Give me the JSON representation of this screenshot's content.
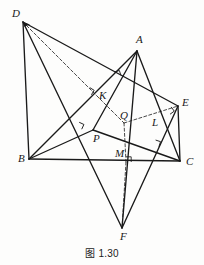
{
  "figure": {
    "caption": "图 1.30",
    "stroke_color": "#1a1a1a",
    "thin_stroke_color": "#4a4a4a",
    "background": "#fdfdfc",
    "vertices": [
      {
        "id": "D",
        "label": "D",
        "x": 23,
        "y": 22,
        "lx": 12,
        "ly": 17
      },
      {
        "id": "A",
        "label": "A",
        "x": 137,
        "y": 51,
        "lx": 136,
        "ly": 43
      },
      {
        "id": "B",
        "label": "B",
        "x": 29,
        "y": 159,
        "lx": 18,
        "ly": 162
      },
      {
        "id": "C",
        "label": "C",
        "x": 180,
        "y": 161,
        "lx": 186,
        "ly": 165
      },
      {
        "id": "E",
        "label": "E",
        "x": 178,
        "y": 106,
        "lx": 182,
        "ly": 106
      },
      {
        "id": "F",
        "label": "F",
        "x": 122,
        "y": 228,
        "lx": 120,
        "ly": 240
      },
      {
        "id": "K",
        "label": "K",
        "x": 87,
        "y": 92,
        "lx": 99,
        "ly": 99
      },
      {
        "id": "Q",
        "label": "Q",
        "x": 124,
        "y": 123,
        "lx": 120,
        "ly": 119
      },
      {
        "id": "P",
        "label": "P",
        "x": 93,
        "y": 130,
        "lx": 93,
        "ly": 142
      },
      {
        "id": "L",
        "label": "L",
        "x": 168,
        "y": 110,
        "lx": 152,
        "ly": 126
      },
      {
        "id": "M",
        "label": "M",
        "x": 126,
        "y": 162,
        "lx": 115,
        "ly": 157
      }
    ],
    "solid_segments": [
      {
        "name": "segment-BC",
        "from": "B",
        "to": "C"
      },
      {
        "name": "segment-AB",
        "from": "B",
        "to": "A"
      },
      {
        "name": "segment-AC",
        "from": "A",
        "to": "C"
      },
      {
        "name": "segment-BP",
        "from": "B",
        "to": "P"
      },
      {
        "name": "segment-PC",
        "from": "P",
        "to": "C"
      },
      {
        "name": "segment-PA",
        "from": "P",
        "to": "A"
      },
      {
        "name": "segment-DB",
        "from": "D",
        "to": "B"
      },
      {
        "name": "segment-DE",
        "from": "D",
        "to": "E"
      },
      {
        "name": "segment-DF",
        "from": "D",
        "to": "F"
      },
      {
        "name": "segment-EC",
        "from": "E",
        "to": "C"
      },
      {
        "name": "segment-EF",
        "from": "E",
        "to": "F"
      },
      {
        "name": "segment-AF",
        "from": "A",
        "to": "F"
      }
    ],
    "dashed_segments": [
      {
        "name": "segment-DQ",
        "from": "D",
        "to": "Q"
      },
      {
        "name": "segment-QE",
        "from": "Q",
        "to": "E"
      },
      {
        "name": "segment-QM",
        "from": "Q",
        "to": "M"
      },
      {
        "name": "segment-MF",
        "from": "M",
        "to": "F"
      }
    ],
    "right_angle_marks": [
      {
        "name": "right-angle-at-K",
        "x": 87,
        "y": 92,
        "rot": 32
      },
      {
        "name": "right-angle-on-DE",
        "x": 116,
        "y": 77,
        "rot": -18
      },
      {
        "name": "right-angle-at-L",
        "x": 167,
        "y": 110,
        "rot": 54
      },
      {
        "name": "right-angle-near-P",
        "x": 77,
        "y": 127,
        "rot": 25
      },
      {
        "name": "right-angle-on-PC",
        "x": 154,
        "y": 145,
        "rot": 18
      },
      {
        "name": "right-angle-at-M",
        "x": 126,
        "y": 162,
        "rot": 0
      }
    ],
    "arrowheads": [
      {
        "name": "arrowhead-at-D",
        "x": 23,
        "y": 22
      }
    ]
  }
}
